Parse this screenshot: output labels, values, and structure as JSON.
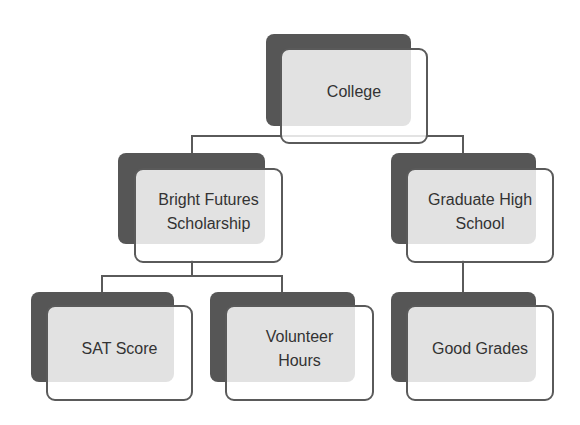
{
  "diagram": {
    "type": "hierarchy",
    "colors": {
      "background": "#ffffff",
      "shadow_box": "#565656",
      "node_fill_overlap": "#e0e0e0",
      "node_outline": "#5a5a5a",
      "text": "#333333",
      "connector": "#5a5a5a"
    },
    "nodes": {
      "college": {
        "label": "College",
        "level": 0
      },
      "bright_futures": {
        "label": "Bright Futures Scholarship",
        "level": 1,
        "parent": "College"
      },
      "graduate_hs": {
        "label": "Graduate High School",
        "level": 1,
        "parent": "College"
      },
      "sat_score": {
        "label": "SAT Score",
        "level": 2,
        "parent": "Bright Futures Scholarship"
      },
      "volunteer_hours": {
        "label": "Volunteer Hours",
        "level": 2,
        "parent": "Bright Futures Scholarship"
      },
      "good_grades": {
        "label": "Good Grades",
        "level": 2,
        "parent": "Graduate High School"
      }
    }
  }
}
